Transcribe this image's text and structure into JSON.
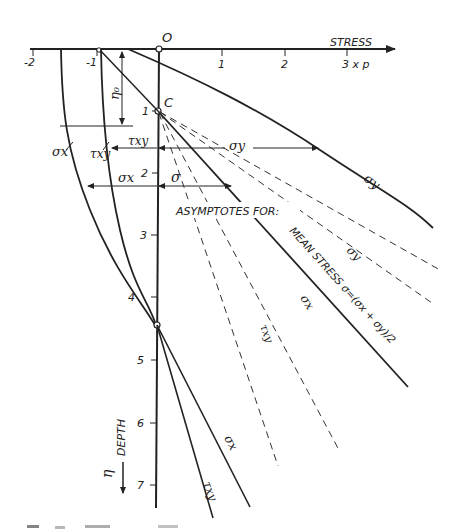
{
  "diagram": {
    "type": "stress-depth diagram",
    "axes": {
      "stress_axis_label": "STRESS",
      "stress_unit_label": "3 x p",
      "stress_ticks": [
        "-2",
        "-1",
        "1",
        "2"
      ],
      "origin_label": "O",
      "depth_axis_label": "DEPTH",
      "depth_symbol": "η",
      "depth_ticks": [
        "1",
        "2",
        "3",
        "4",
        "5",
        "6",
        "7"
      ]
    },
    "points": {
      "c_label": "C",
      "eta0_label": "η₀"
    },
    "curve_labels": {
      "sigma_x_left": "σx",
      "tau_xy_left": "τxy",
      "sigma_y": "σy",
      "tau_xy_bottom": "τxy",
      "sigma_x_bottom": "σx"
    },
    "dimension_labels": {
      "tau_xy": "τxy",
      "sigma_y": "σy",
      "sigma_x": "σx",
      "sigma": "σ"
    },
    "asymptotes": {
      "title": "ASYMPTOTES FOR:",
      "mean_stress": "MEAN STRESS σ=(σx + σy)/2",
      "sigma_y": "σy",
      "sigma_x": "σx",
      "tau_xy": "τxy"
    },
    "colors": {
      "ink": "#222222",
      "background": "#ffffff"
    }
  }
}
